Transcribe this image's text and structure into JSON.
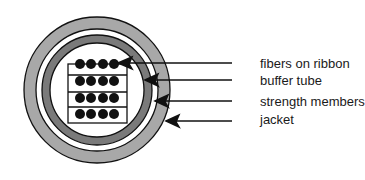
{
  "diagram": {
    "type": "cable-cross-section",
    "colors": {
      "jacket": "#a8a8a8",
      "buffer_tube": "#7a7a7a",
      "fiber": "#111111",
      "outline": "#111111",
      "background": "#ffffff"
    },
    "ribbon_grid": {
      "rows": 4,
      "fibers_per_row": 4
    },
    "labels": [
      {
        "id": "fibers",
        "text": "fibers on ribbon"
      },
      {
        "id": "buffer",
        "text": "buffer tube"
      },
      {
        "id": "strength",
        "text": "strength members"
      },
      {
        "id": "jacket",
        "text": "jacket"
      }
    ]
  }
}
